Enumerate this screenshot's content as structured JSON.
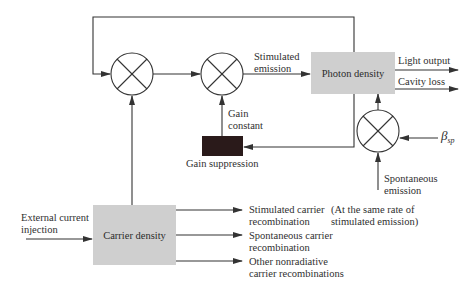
{
  "diagram": {
    "type": "block-diagram",
    "blocks": {
      "photon_density": "Photon density",
      "carrier_density": "Carrier density",
      "gain_suppression": "Gain suppression"
    },
    "multipliers": [
      {
        "id": "mult-1",
        "symbol": "⊗"
      },
      {
        "id": "mult-2",
        "symbol": "⊗"
      },
      {
        "id": "mult-3",
        "symbol": "⊗"
      }
    ],
    "labels": {
      "stimulated_emission_1": "Stimulated",
      "stimulated_emission_2": "emission",
      "light_output": "Light  output",
      "cavity_loss": "Cavity loss",
      "gain_constant_1": "Gain",
      "gain_constant_2": "constant",
      "gain_suppression": "Gain suppression",
      "beta_symbol": "β",
      "beta_subscript": "sp",
      "spontaneous_emission_1": "Spontaneous",
      "spontaneous_emission_2": "emission",
      "external_current_1": "External current",
      "external_current_2": "injection",
      "stim_carrier_1": "Stimulated carrier",
      "stim_carrier_2": "recombination",
      "same_rate_1": "(At the same rate of",
      "same_rate_2": "stimulated emission)",
      "spont_carrier_1": "Spontaneous carrier",
      "spont_carrier_2": "recombination",
      "other_nonrad_1": "Other nonradiative",
      "other_nonrad_2": "carrier recombinations"
    },
    "colors": {
      "box_fill": "#cfcfcf",
      "suppression_fill": "#2a1a1a",
      "line": "#333333"
    }
  }
}
